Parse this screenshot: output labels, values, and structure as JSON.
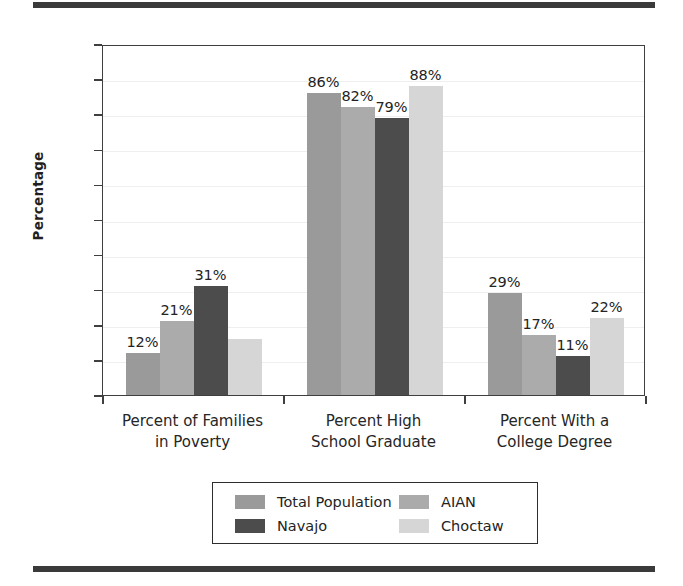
{
  "chart_data": {
    "type": "bar",
    "title": "",
    "subtitle": "",
    "xlabel": "",
    "ylabel": "Percentage",
    "ylim": [
      0,
      100
    ],
    "ytick_step": 10,
    "yticks": [
      0,
      10,
      20,
      30,
      40,
      50,
      60,
      70,
      80,
      90,
      100
    ],
    "grid": true,
    "legend_position": "bottom",
    "categories": [
      "Percent of Families in Poverty",
      "Percent High School Graduate",
      "Percent With a College Degree"
    ],
    "category_lines": [
      [
        "Percent of Families",
        "in Poverty"
      ],
      [
        "Percent High",
        "School Graduate"
      ],
      [
        "Percent With a",
        "College Degree"
      ]
    ],
    "series": [
      {
        "name": "Total Population",
        "color": "#9a9a9a",
        "values": [
          12,
          86,
          29
        ],
        "labels": [
          "12%",
          "86%",
          "29%"
        ]
      },
      {
        "name": "AIAN",
        "color": "#ababab",
        "values": [
          21,
          82,
          17
        ],
        "labels": [
          "21%",
          "82%",
          "17%"
        ]
      },
      {
        "name": "Navajo",
        "color": "#4c4c4c",
        "values": [
          31,
          79,
          11
        ],
        "labels": [
          "31%",
          "79%",
          "11%"
        ]
      },
      {
        "name": "Choctaw",
        "color": "#d6d6d6",
        "values": [
          16,
          88,
          22
        ],
        "labels": [
          "",
          "88%",
          "22%"
        ]
      }
    ]
  },
  "legend": {
    "entries": [
      {
        "label": "Total Population",
        "color": "#9a9a9a"
      },
      {
        "label": "AIAN",
        "color": "#ababab"
      },
      {
        "label": "Navajo",
        "color": "#4c4c4c"
      },
      {
        "label": "Choctaw",
        "color": "#d6d6d6"
      }
    ]
  },
  "axis": {
    "y_title": "Percentage",
    "y_tick_labels": [
      "100",
      "90",
      "80",
      "70",
      "60",
      "50",
      "40",
      "30",
      "20",
      "10",
      "0"
    ]
  },
  "colors": {
    "rule": "#3a3a3a",
    "frame": "#3f3f3f",
    "text": "#232323",
    "grid": "#efefef"
  }
}
